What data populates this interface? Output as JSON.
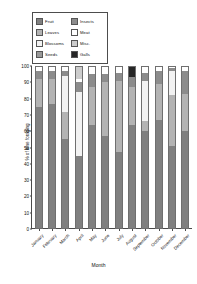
{
  "chart_data": {
    "type": "bar",
    "subtype": "stacked-bar-100",
    "title": "",
    "xlabel": "Month",
    "ylabel": "% of time foraging",
    "ylim": [
      0,
      100
    ],
    "yticks": [
      0,
      10,
      20,
      30,
      40,
      50,
      60,
      70,
      80,
      90,
      100
    ],
    "grid": false,
    "legend_position": "top-left-inside",
    "categories": [
      "January",
      "February",
      "March",
      "April",
      "May",
      "June",
      "July",
      "August",
      "September",
      "October",
      "November",
      "December"
    ],
    "series": [
      {
        "name": "Fruit",
        "color": "#808080",
        "values": [
          75,
          77,
          55,
          45,
          64,
          57,
          47,
          64,
          60,
          67,
          51,
          60
        ]
      },
      {
        "name": "Leaves",
        "color": "#b3b3b3",
        "values": [
          17,
          15,
          17,
          0,
          23,
          33,
          44,
          23,
          6,
          22,
          31,
          23
        ]
      },
      {
        "name": "Blossoms",
        "color": "#f2f2f2",
        "values": [
          0,
          0,
          22,
          39,
          0,
          0,
          0,
          0,
          25,
          0,
          15,
          0
        ]
      },
      {
        "name": "Seeds",
        "color": "#999999",
        "values": [
          0,
          0,
          0,
          0,
          0,
          0,
          0,
          0,
          0,
          0,
          0,
          0
        ]
      },
      {
        "name": "Insects",
        "color": "#8c8c8c",
        "values": [
          5,
          5,
          3,
          6,
          8,
          5,
          5,
          6,
          5,
          8,
          2,
          14
        ]
      },
      {
        "name": "Meat",
        "color": "#ffffff",
        "values": [
          3,
          3,
          3,
          2,
          5,
          5,
          4,
          0,
          4,
          3,
          1,
          3
        ]
      },
      {
        "name": "Misc.",
        "color": "#cccccc",
        "values": [
          0,
          0,
          0,
          8,
          0,
          0,
          0,
          0,
          0,
          0,
          0,
          0
        ]
      },
      {
        "name": "Galls",
        "color": "#262626",
        "values": [
          0,
          0,
          0,
          0,
          0,
          0,
          0,
          7,
          0,
          0,
          0,
          0
        ]
      }
    ]
  },
  "legend": {
    "entries": [
      {
        "label": "Fruit",
        "color": "#808080"
      },
      {
        "label": "Insects",
        "color": "#8c8c8c"
      },
      {
        "label": "Leaves",
        "color": "#b3b3b3"
      },
      {
        "label": "Meat",
        "color": "#ffffff"
      },
      {
        "label": "Blossoms",
        "color": "#f2f2f2"
      },
      {
        "label": "Misc.",
        "color": "#cccccc"
      },
      {
        "label": "Seeds",
        "color": "#999999"
      },
      {
        "label": "Galls",
        "color": "#262626"
      }
    ]
  },
  "axes": {
    "y_title": "% of time foraging",
    "x_title": "Month"
  }
}
